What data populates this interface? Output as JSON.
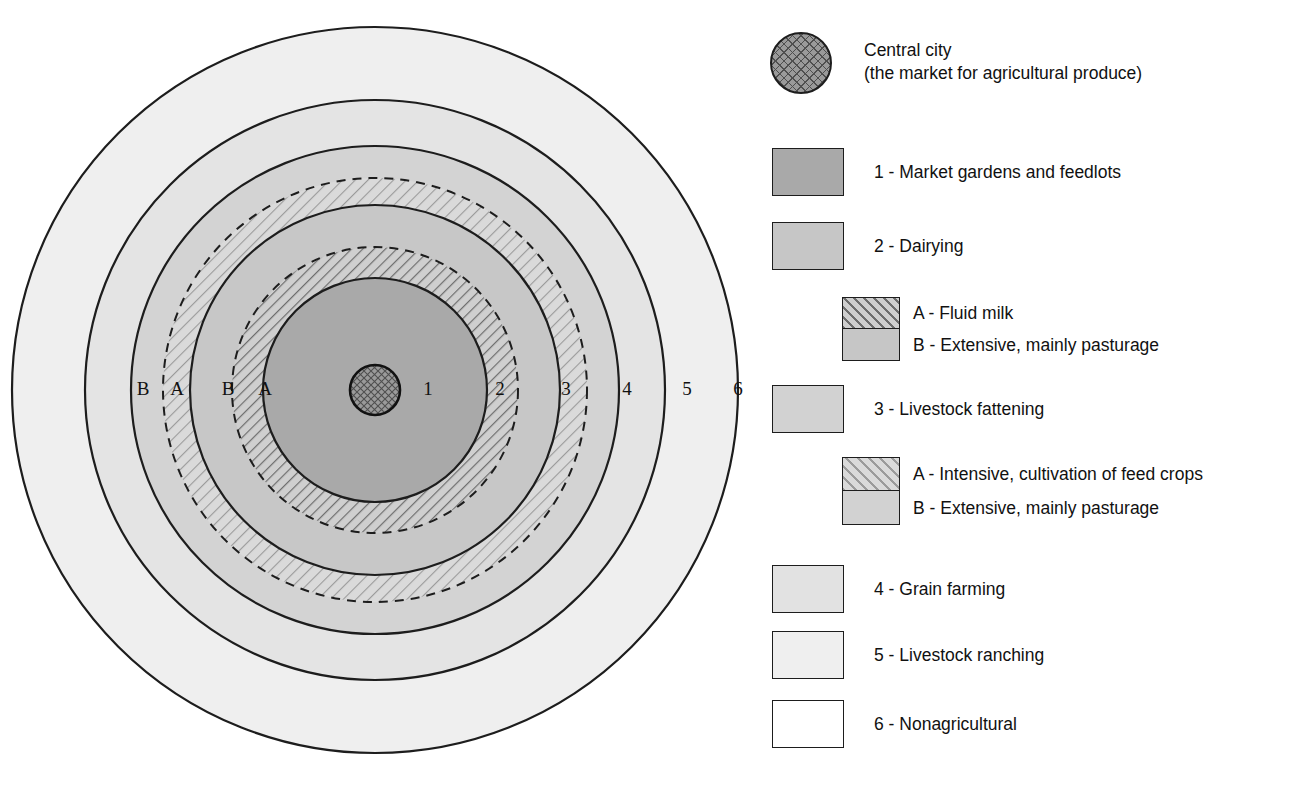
{
  "diagram": {
    "type": "concentric-zone-diagram",
    "center": {
      "x": 375,
      "y": 390
    },
    "ring_labels": [
      {
        "text": "1",
        "x": 428,
        "y": 391
      },
      {
        "text": "2",
        "x": 500,
        "y": 391
      },
      {
        "text": "3",
        "x": 566,
        "y": 391
      },
      {
        "text": "4",
        "x": 627,
        "y": 391
      },
      {
        "text": "5",
        "x": 687,
        "y": 391
      },
      {
        "text": "6",
        "x": 738,
        "y": 391
      },
      {
        "text": "A",
        "x": 265,
        "y": 391
      },
      {
        "text": "B",
        "x": 228,
        "y": 391
      },
      {
        "text": "A",
        "x": 177,
        "y": 391
      },
      {
        "text": "B",
        "x": 143,
        "y": 391
      }
    ],
    "zones": [
      {
        "name": "central-city",
        "radius": 25,
        "fill": "crosshatch"
      },
      {
        "name": "zone-1",
        "radius": 112,
        "fill": "#a9a9a9"
      },
      {
        "name": "zone-2a",
        "radius": 143,
        "fill": "diagonal-hatch-dense"
      },
      {
        "name": "zone-2b",
        "radius": 185,
        "fill": "#c6c6c6"
      },
      {
        "name": "zone-3a",
        "radius": 212,
        "fill": "diagonal-hatch-light"
      },
      {
        "name": "zone-3b",
        "radius": 244,
        "fill": "#d2d2d2"
      },
      {
        "name": "zone-4",
        "radius": 290,
        "fill": "#e2e2e2"
      },
      {
        "name": "zone-5",
        "radius": 363,
        "fill": "#efefef"
      },
      {
        "name": "zone-6",
        "radius": null,
        "fill": "#ffffff"
      }
    ]
  },
  "legend": {
    "items": [
      {
        "key": "central-city",
        "label": "Central city\n(the market for agricultural produce)",
        "swatch": {
          "shape": "circle",
          "fill": "crosshatch",
          "size": 62
        }
      },
      {
        "key": "zone-1",
        "label": "1 - Market gardens and feedlots",
        "swatch": {
          "shape": "rect",
          "fill": "#a9a9a9",
          "width": 72,
          "height": 48
        }
      },
      {
        "key": "zone-2",
        "label": "2 - Dairying",
        "swatch": {
          "shape": "rect",
          "fill": "#c6c6c6",
          "width": 72,
          "height": 48
        }
      },
      {
        "key": "zone-3",
        "label": "3 - Livestock fattening",
        "swatch": {
          "shape": "rect",
          "fill": "#d2d2d2",
          "width": 72,
          "height": 48
        }
      },
      {
        "key": "zone-4",
        "label": "4 - Grain farming",
        "swatch": {
          "shape": "rect",
          "fill": "#e2e2e2",
          "width": 72,
          "height": 48
        }
      },
      {
        "key": "zone-5",
        "label": "5 - Livestock ranching",
        "swatch": {
          "shape": "rect",
          "fill": "#efefef",
          "width": 72,
          "height": 48
        }
      },
      {
        "key": "zone-6",
        "label": "6 - Nonagricultural",
        "swatch": {
          "shape": "rect",
          "fill": "#ffffff",
          "width": 72,
          "height": 48
        }
      }
    ],
    "sub_legends": [
      {
        "key": "zone-2-sub",
        "parent": "zone-2",
        "a_label": "A - Fluid milk",
        "b_label": "B - Extensive, mainly pasturage",
        "a_fill": "diagonal-hatch-dense",
        "b_fill": "#c6c6c6"
      },
      {
        "key": "zone-3-sub",
        "parent": "zone-3",
        "a_label": "A - Intensive, cultivation of feed crops",
        "b_label": "B - Extensive, mainly pasturage",
        "a_fill": "diagonal-hatch-light",
        "b_fill": "#d2d2d2"
      }
    ]
  },
  "colors": {
    "outline": "#1d1d1d",
    "text": "#111111",
    "background": "#ffffff"
  }
}
